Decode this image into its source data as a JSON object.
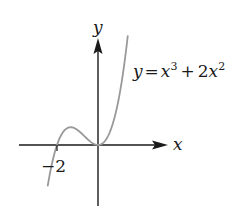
{
  "chart_data": {
    "type": "line",
    "title": "",
    "equation_label": "y = x³ + 2x²",
    "equation_parts": {
      "lhs": "y",
      "eq": "=",
      "t1_base": "x",
      "t1_exp": "3",
      "plus": "+",
      "t2_coef": "2",
      "t2_base": "x",
      "t2_exp": "2"
    },
    "xlabel": "x",
    "ylabel": "y",
    "x_tick_labels": [
      {
        "value": -2,
        "label": "−2"
      }
    ],
    "function": "x^3 + 2x^2",
    "series": [
      {
        "name": "y = x^3 + 2x^2",
        "color": "#999999",
        "x": [
          -2.45,
          -2.25,
          -2.0,
          -1.75,
          -1.5,
          -1.333,
          -1.0,
          -0.75,
          -0.5,
          -0.25,
          0.0,
          0.25,
          0.5,
          0.75,
          1.0,
          1.25,
          1.45
        ],
        "y": [
          -2.7,
          -0.28,
          0.0,
          0.77,
          1.125,
          1.185,
          1.0,
          0.7,
          0.375,
          0.11,
          0.0,
          0.14,
          0.625,
          1.55,
          3.0,
          5.08,
          7.25
        ]
      }
    ],
    "key_points": [
      {
        "name": "root",
        "x": -2,
        "y": 0
      },
      {
        "name": "local-max",
        "x": -1.333,
        "y": 1.185
      },
      {
        "name": "local-min/root",
        "x": 0,
        "y": 0
      }
    ],
    "xlim": [
      -3.8,
      3.4
    ],
    "ylim": [
      -4.1,
      7.3
    ],
    "grid": false,
    "legend": "none",
    "axis_color": "#1a1a1a",
    "curve_color": "#999999"
  }
}
